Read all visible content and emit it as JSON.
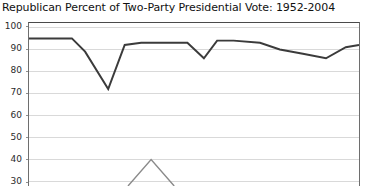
{
  "chart_data": {
    "type": "line",
    "title": "Republican Percent of Two-Party Presidential Vote: 1952-2004",
    "xlabel": "",
    "ylabel": "",
    "ylim": [
      28,
      102
    ],
    "xlim": [
      0,
      100
    ],
    "grid": true,
    "grid_axis": "y",
    "legend": "none",
    "yticks": [
      100,
      90,
      80,
      70,
      60,
      50,
      40,
      30
    ],
    "ytick_labels": [
      "100",
      "90",
      "80",
      "70",
      "60",
      "50",
      "40",
      "30"
    ],
    "series": [
      {
        "name": "Primary district series",
        "color": "#3b3b3b",
        "x": [
          0,
          8,
          13,
          17,
          24,
          29,
          34,
          41,
          48,
          53,
          57,
          62,
          70,
          76,
          83,
          90,
          96,
          100
        ],
        "values": [
          95,
          95,
          95,
          89,
          72,
          92,
          93,
          93,
          93,
          86,
          94,
          94,
          93,
          90,
          88,
          86,
          91,
          92
        ]
      },
      {
        "name": "Secondary district series",
        "color": "#8a8a8a",
        "x": [
          30,
          37,
          44
        ],
        "values": [
          28,
          40,
          28
        ]
      }
    ]
  }
}
